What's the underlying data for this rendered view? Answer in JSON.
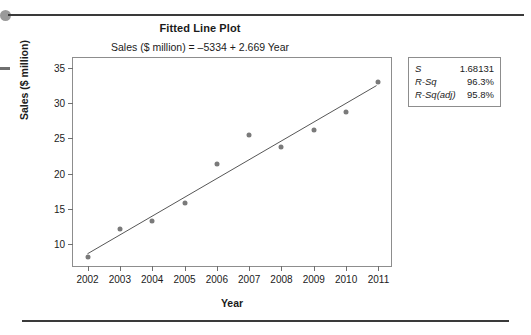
{
  "page": {
    "top_rule": "horizontal-rule",
    "bottom_rule": "horizontal-rule",
    "bullet": "bullet-marker",
    "left_dash": "margin-dash"
  },
  "chart_data": {
    "type": "scatter",
    "title": "Fitted Line Plot",
    "subtitle": "Sales ($ million) = –5334 + 2.669 Year",
    "xlabel": "Year",
    "ylabel": "Sales ($ million)",
    "x": [
      2002,
      2003,
      2004,
      2005,
      2006,
      2007,
      2008,
      2009,
      2010,
      2011
    ],
    "values": [
      8.1,
      12.2,
      13.2,
      15.8,
      21.3,
      25.5,
      23.7,
      26.2,
      28.8,
      33.0
    ],
    "xticks": [
      "2002",
      "2003",
      "2004",
      "2005",
      "2006",
      "2007",
      "2008",
      "2009",
      "2010",
      "2011"
    ],
    "yticks": [
      "10",
      "15",
      "20",
      "25",
      "30",
      "35"
    ],
    "xlim": [
      2001.55,
      2011.45
    ],
    "ylim": [
      6.6,
      36.4
    ],
    "grid": false,
    "legend": "none",
    "fit_line": {
      "intercept": -5334,
      "slope": 2.669,
      "label": "Sales ($ million) = –5334 + 2.669 Year",
      "x_start": 2002,
      "x_end": 2011,
      "y_start": 8.44,
      "y_end": 32.46
    },
    "point_color": "#7a7a7a",
    "line_color": "#555555"
  },
  "stats": {
    "rows": [
      {
        "key": "S",
        "value": "1.68131"
      },
      {
        "key": "R-Sq",
        "value": "96.3%"
      },
      {
        "key": "R-Sq(adj)",
        "value": "95.8%"
      }
    ]
  }
}
